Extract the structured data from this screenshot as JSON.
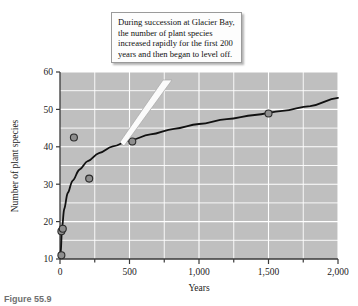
{
  "callout": {
    "text": "During succession at Glacier Bay, the number of plant species increased rapidly for the first 200 years and then began to level off."
  },
  "caption": {
    "figure_number": "Figure 55.9",
    "text": ""
  },
  "colors": {
    "plot_background": "#bfbfbf",
    "gridline": "#ffffff",
    "curve": "#111111",
    "point_fill": "#8e8e8e",
    "point_stroke": "#2b2b2b",
    "axis": "#3a3a3a",
    "callout_background": "#fdfdfd",
    "callout_border": "#9a9a9a",
    "text": "#1a1a1a"
  },
  "chart_data": {
    "type": "scatter",
    "title": "",
    "xlabel": "Years",
    "ylabel": "Number of plant species",
    "xlim": [
      0,
      2000
    ],
    "ylim": [
      10,
      60
    ],
    "grid": true,
    "legend": "none",
    "x_ticks": [
      0,
      500,
      1000,
      1500,
      2000
    ],
    "x_tick_labels": [
      "0",
      "500",
      "1,000",
      "1,500",
      "2,000"
    ],
    "x_minor_tick_step": 250,
    "y_ticks": [
      10,
      20,
      30,
      40,
      50,
      60
    ],
    "y_tick_labels": [
      "10",
      "20",
      "30",
      "40",
      "50",
      "60"
    ],
    "y_gridline_step": 5,
    "points": [
      {
        "x": 10,
        "y": 11.0
      },
      {
        "x": 10,
        "y": 17.4
      },
      {
        "x": 20,
        "y": 18.1
      },
      {
        "x": 100,
        "y": 42.5
      },
      {
        "x": 210,
        "y": 31.5
      },
      {
        "x": 520,
        "y": 41.4
      },
      {
        "x": 1500,
        "y": 48.9
      }
    ],
    "series": [
      {
        "name": "fitted curve",
        "type": "line",
        "x": [
          5,
          15,
          30,
          55,
          90,
          140,
          200,
          280,
          380,
          500,
          650,
          820,
          1000,
          1200,
          1400,
          1600,
          1800,
          2000
        ],
        "values": [
          12.0,
          18.5,
          23.3,
          27.6,
          30.9,
          33.9,
          36.2,
          38.3,
          40.1,
          41.7,
          43.3,
          44.8,
          46.1,
          47.4,
          48.5,
          49.6,
          50.9,
          53.1
        ]
      }
    ]
  },
  "axis_labels": {
    "x_title": "Years",
    "y_title": "Number of plant species"
  }
}
